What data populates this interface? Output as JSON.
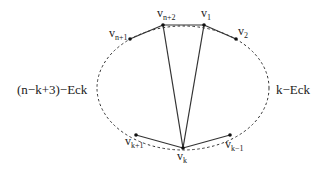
{
  "diagram": {
    "type": "graph",
    "colors": {
      "line": "#333333",
      "node": "#111111",
      "text": "#222222",
      "background": "#ffffff"
    },
    "ellipse": {
      "cx": 183,
      "cy": 88,
      "rx": 86,
      "ry": 62,
      "style": "dashed"
    },
    "nodes": [
      {
        "id": "v_n+2",
        "base": "v",
        "sub": "n+2",
        "x": 163,
        "y": 25,
        "lx": 157,
        "ly": 17
      },
      {
        "id": "v_1",
        "base": "v",
        "sub": "1",
        "x": 204,
        "y": 25,
        "lx": 201,
        "ly": 17
      },
      {
        "id": "v_n+1",
        "base": "v",
        "sub": "n+1",
        "x": 130,
        "y": 39,
        "lx": 109,
        "ly": 37
      },
      {
        "id": "v_2",
        "base": "v",
        "sub": "2",
        "x": 236,
        "y": 39,
        "lx": 238,
        "ly": 35
      },
      {
        "id": "v_k+1",
        "base": "v",
        "sub": "k+1",
        "x": 136,
        "y": 135,
        "lx": 125,
        "ly": 145
      },
      {
        "id": "v_k-1",
        "base": "v",
        "sub": "k-1",
        "x": 230,
        "y": 135,
        "lx": 225,
        "ly": 148
      },
      {
        "id": "v_k",
        "base": "v",
        "sub": "k",
        "x": 183,
        "y": 148,
        "lx": 177,
        "ly": 160
      }
    ],
    "edges": [
      {
        "from": "v_n+1",
        "to": "v_n+2"
      },
      {
        "from": "v_n+2",
        "to": "v_1"
      },
      {
        "from": "v_1",
        "to": "v_2"
      },
      {
        "from": "v_k+1",
        "to": "v_k"
      },
      {
        "from": "v_k",
        "to": "v_k-1"
      },
      {
        "from": "v_n+2",
        "to": "v_k"
      },
      {
        "from": "v_1",
        "to": "v_k"
      }
    ],
    "regions": [
      {
        "id": "left",
        "label": "(n−k+3)−Eck",
        "x": 17,
        "y": 94
      },
      {
        "id": "right",
        "label": "k−Eck",
        "x": 276,
        "y": 94
      }
    ]
  }
}
